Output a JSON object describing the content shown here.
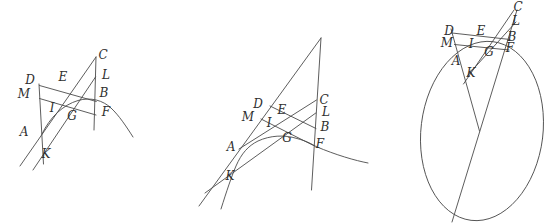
{
  "page": {
    "background": "#ffffff",
    "ink": "#4b4b4b",
    "label_ink": "#2f2f2f",
    "stroke_width": 0.9
  },
  "figures": [
    {
      "id": "figure-parabola-case",
      "labels": [
        {
          "t": "D",
          "x": 30,
          "y": 80
        },
        {
          "t": "M",
          "x": 24,
          "y": 94
        },
        {
          "t": "A",
          "x": 24,
          "y": 132
        },
        {
          "t": "K",
          "x": 46,
          "y": 154
        },
        {
          "t": "E",
          "x": 63,
          "y": 77
        },
        {
          "t": "I",
          "x": 52,
          "y": 108
        },
        {
          "t": "G",
          "x": 72,
          "y": 116
        },
        {
          "t": "C",
          "x": 103,
          "y": 55
        },
        {
          "t": "L",
          "x": 106,
          "y": 75
        },
        {
          "t": "B",
          "x": 104,
          "y": 93
        },
        {
          "t": "F",
          "x": 106,
          "y": 112
        }
      ],
      "lines": [
        {
          "name": "line-DMAK",
          "pts": [
            39,
            84,
            43.5,
            164
          ]
        },
        {
          "name": "line-CLBF",
          "pts": [
            96,
            57,
            94,
            130
          ]
        },
        {
          "name": "line-DB",
          "pts": [
            39.5,
            85.5,
            96.3,
            101.5
          ]
        },
        {
          "name": "line-MF",
          "pts": [
            39.5,
            98.5,
            96,
            115
          ]
        },
        {
          "name": "line-AC",
          "pts": [
            20,
            166,
            96,
            57
          ]
        },
        {
          "name": "line-KL",
          "pts": [
            33,
            170,
            95.5,
            77
          ]
        }
      ],
      "curves": [
        {
          "name": "conic-arc",
          "d": "M 42,134 C 50,117 63,105 78,100.5 C 91,96.8 103,100.5 111,108 C 119,115.5 126,126 133,137"
        }
      ],
      "ellipse": null
    },
    {
      "id": "figure-hyperbola-case",
      "labels": [
        {
          "t": "D",
          "x": 258,
          "y": 104
        },
        {
          "t": "M",
          "x": 248,
          "y": 117
        },
        {
          "t": "E",
          "x": 282,
          "y": 110
        },
        {
          "t": "I",
          "x": 269,
          "y": 123
        },
        {
          "t": "G",
          "x": 287,
          "y": 138
        },
        {
          "t": "A",
          "x": 231,
          "y": 147
        },
        {
          "t": "K",
          "x": 230,
          "y": 176
        },
        {
          "t": "C",
          "x": 324,
          "y": 100
        },
        {
          "t": "L",
          "x": 326,
          "y": 112
        },
        {
          "t": "B",
          "x": 325,
          "y": 127
        },
        {
          "t": "F",
          "x": 320,
          "y": 144
        }
      ],
      "lines": [
        {
          "name": "line-ADM-apex",
          "pts": [
            199,
            206,
            321,
            38
          ]
        },
        {
          "name": "line-CLBF",
          "pts": [
            321,
            38,
            311.5,
            190
          ]
        },
        {
          "name": "line-DB",
          "pts": [
            270,
            106,
            316,
            128.5
          ]
        },
        {
          "name": "line-MF",
          "pts": [
            261,
            119,
            314.5,
            146
          ]
        },
        {
          "name": "line-AC",
          "pts": [
            239,
            149,
            316.5,
            100
          ]
        },
        {
          "name": "line-KL",
          "pts": [
            205,
            193,
            315.8,
            113
          ]
        }
      ],
      "curves": [
        {
          "name": "conic-arc",
          "d": "M 221,209 C 227,190 231,178 236,166 C 241.5,153.5 248,146 258,141 C 270,135.5 284,134.5 297,138.5 C 306,141 311,143.5 316,146.5 C 336,155 355,160.5 368,163"
        }
      ],
      "ellipse": null
    },
    {
      "id": "figure-ellipse-case",
      "labels": [
        {
          "t": "D",
          "x": 449,
          "y": 31
        },
        {
          "t": "M",
          "x": 447,
          "y": 43
        },
        {
          "t": "E",
          "x": 481,
          "y": 31
        },
        {
          "t": "I",
          "x": 471,
          "y": 44
        },
        {
          "t": "G",
          "x": 489,
          "y": 52
        },
        {
          "t": "A",
          "x": 456,
          "y": 61
        },
        {
          "t": "K",
          "x": 471,
          "y": 73
        },
        {
          "t": "C",
          "x": 518,
          "y": 7
        },
        {
          "t": "L",
          "x": 516,
          "y": 21
        },
        {
          "t": "B",
          "x": 512,
          "y": 37
        },
        {
          "t": "F",
          "x": 510,
          "y": 48
        }
      ],
      "lines": [
        {
          "name": "line-CBF-diameter",
          "pts": [
            517,
            10,
            452,
            222
          ]
        },
        {
          "name": "line-DMA-center",
          "pts": [
            451,
            29,
            479.5,
            131
          ]
        },
        {
          "name": "line-CK",
          "pts": [
            514,
            10,
            463.5,
            84
          ]
        },
        {
          "name": "line-DB",
          "pts": [
            452,
            33,
            510,
            39.5
          ]
        },
        {
          "name": "line-MF",
          "pts": [
            454.5,
            44.5,
            509,
            50
          ]
        },
        {
          "name": "line-KL",
          "pts": [
            467.5,
            75.5,
            516,
            22
          ]
        }
      ],
      "curves": [],
      "ellipse": {
        "cx": 482,
        "cy": 131,
        "rx": 61,
        "ry": 90,
        "rotate": 7
      }
    }
  ]
}
